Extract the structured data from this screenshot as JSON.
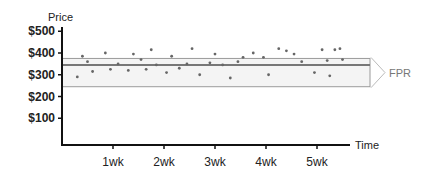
{
  "chart_data": {
    "type": "scatter",
    "title": "",
    "xlabel": "Time",
    "ylabel": "Price",
    "y_ticks": [
      "$500",
      "$400",
      "$300",
      "$200",
      "$100"
    ],
    "y_tick_values": [
      500,
      400,
      300,
      200,
      100
    ],
    "x_ticks": [
      "1wk",
      "2wk",
      "3wk",
      "4wk",
      "5wk"
    ],
    "x_tick_values": [
      1,
      2,
      3,
      4,
      5
    ],
    "ylim": [
      0,
      520
    ],
    "xlim": [
      0,
      5.6
    ],
    "band": {
      "label": "FPR",
      "upper": 375,
      "center": 345,
      "lower": 245
    },
    "points": [
      {
        "x": 0.3,
        "y": 290
      },
      {
        "x": 0.4,
        "y": 385
      },
      {
        "x": 0.5,
        "y": 360
      },
      {
        "x": 0.6,
        "y": 315
      },
      {
        "x": 0.85,
        "y": 400
      },
      {
        "x": 0.95,
        "y": 325
      },
      {
        "x": 1.1,
        "y": 350
      },
      {
        "x": 1.3,
        "y": 320
      },
      {
        "x": 1.4,
        "y": 395
      },
      {
        "x": 1.55,
        "y": 370
      },
      {
        "x": 1.65,
        "y": 325
      },
      {
        "x": 1.75,
        "y": 415
      },
      {
        "x": 1.85,
        "y": 345
      },
      {
        "x": 2.05,
        "y": 310
      },
      {
        "x": 2.15,
        "y": 385
      },
      {
        "x": 2.3,
        "y": 330
      },
      {
        "x": 2.45,
        "y": 350
      },
      {
        "x": 2.55,
        "y": 420
      },
      {
        "x": 2.7,
        "y": 300
      },
      {
        "x": 2.9,
        "y": 355
      },
      {
        "x": 3.0,
        "y": 395
      },
      {
        "x": 3.15,
        "y": 345
      },
      {
        "x": 3.3,
        "y": 285
      },
      {
        "x": 3.45,
        "y": 360
      },
      {
        "x": 3.55,
        "y": 380
      },
      {
        "x": 3.75,
        "y": 400
      },
      {
        "x": 3.95,
        "y": 380
      },
      {
        "x": 4.05,
        "y": 300
      },
      {
        "x": 4.25,
        "y": 420
      },
      {
        "x": 4.4,
        "y": 410
      },
      {
        "x": 4.55,
        "y": 395
      },
      {
        "x": 4.7,
        "y": 360
      },
      {
        "x": 4.95,
        "y": 310
      },
      {
        "x": 5.1,
        "y": 415
      },
      {
        "x": 5.2,
        "y": 365
      },
      {
        "x": 5.25,
        "y": 295
      },
      {
        "x": 5.35,
        "y": 415
      },
      {
        "x": 5.45,
        "y": 420
      },
      {
        "x": 5.5,
        "y": 370
      }
    ],
    "grid": false,
    "legend": "none"
  },
  "colors": {
    "axis": "#111111",
    "band_fill": "#f4f4f4",
    "band_line": "#9a9a9a",
    "center_line": "#777777",
    "point": "#666666",
    "fpr_label": "#777777"
  }
}
